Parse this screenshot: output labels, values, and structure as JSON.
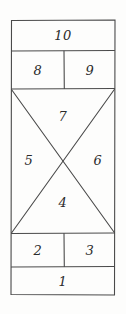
{
  "figure": {
    "style": "hand-drawn pencil sketch",
    "stroke_color": "#4a4a4a",
    "background_color": "#fdfdfc",
    "outer_rect": {
      "x": 11,
      "y": 20,
      "width": 104,
      "height": 275
    },
    "dividers": {
      "horizontal_y": [
        51,
        89,
        233,
        267
      ],
      "vertical_x": 64
    },
    "cross_section": {
      "top": 89,
      "bottom": 233,
      "left": 11,
      "right": 115
    }
  },
  "labels": [
    {
      "id": "region-10",
      "text": "10",
      "x": 63,
      "y": 35,
      "region": "top-full-width-band"
    },
    {
      "id": "region-8",
      "text": "8",
      "x": 38,
      "y": 70,
      "region": "second-band-left"
    },
    {
      "id": "region-9",
      "text": "9",
      "x": 90,
      "y": 70,
      "region": "second-band-right"
    },
    {
      "id": "region-7",
      "text": "7",
      "x": 63,
      "y": 116,
      "region": "cross-top-triangle"
    },
    {
      "id": "region-5",
      "text": "5",
      "x": 29,
      "y": 160,
      "region": "cross-left-triangle"
    },
    {
      "id": "region-6",
      "text": "6",
      "x": 98,
      "y": 160,
      "region": "cross-right-triangle"
    },
    {
      "id": "region-4",
      "text": "4",
      "x": 63,
      "y": 202,
      "region": "cross-bottom-triangle"
    },
    {
      "id": "region-2",
      "text": "2",
      "x": 38,
      "y": 250,
      "region": "fourth-band-left"
    },
    {
      "id": "region-3",
      "text": "3",
      "x": 90,
      "y": 250,
      "region": "fourth-band-right"
    },
    {
      "id": "region-1",
      "text": "1",
      "x": 63,
      "y": 281,
      "region": "bottom-full-width-band"
    }
  ]
}
